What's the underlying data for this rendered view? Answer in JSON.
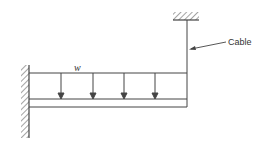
{
  "diagram": {
    "labels": {
      "load": "w",
      "cable": "Cable"
    },
    "elements": {
      "wall": {
        "x": 29,
        "y_top": 65,
        "y_bottom": 138
      },
      "ceiling": {
        "x_left": 173,
        "x_right": 199,
        "y": 20
      },
      "beam": {
        "x_left": 29,
        "x_right": 187,
        "y_top": 99,
        "y_bottom": 107
      },
      "load_top_line": {
        "y": 73
      },
      "load_arrows_x": [
        61,
        93,
        124,
        155
      ],
      "cable": {
        "x": 187,
        "y_top": 20,
        "y_bottom": 73
      }
    },
    "colors": {
      "line": "#444444",
      "background": "#ffffff"
    }
  }
}
